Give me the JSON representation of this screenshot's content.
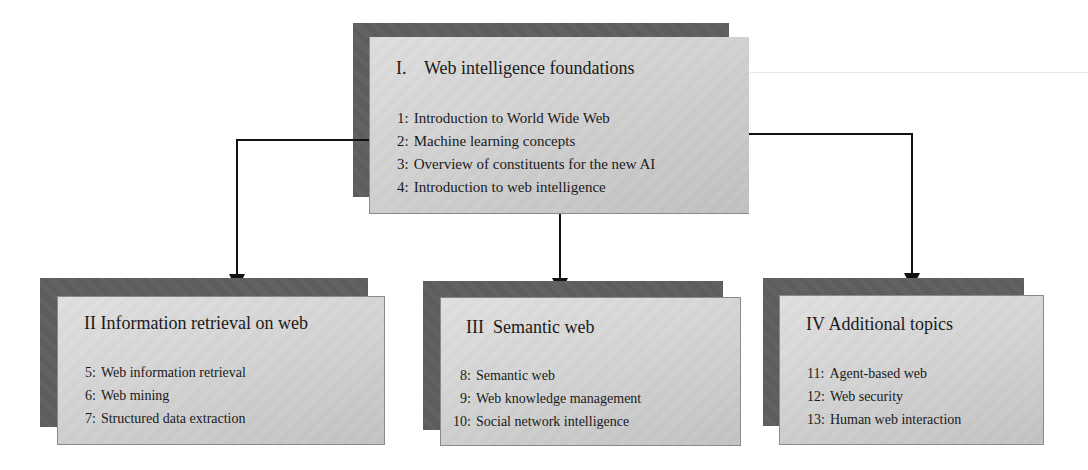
{
  "diagram": {
    "top": {
      "roman": "I.",
      "title": "Web intelligence foundations",
      "items": [
        {
          "num": "1:",
          "label": "Introduction to World Wide Web"
        },
        {
          "num": "2:",
          "label": "Machine learning concepts"
        },
        {
          "num": "3:",
          "label": "Overview of constituents for the new AI"
        },
        {
          "num": "4:",
          "label": "Introduction to web intelligence"
        }
      ]
    },
    "left": {
      "roman": "II",
      "title": "Information retrieval on web",
      "items": [
        {
          "num": "5:",
          "label": "Web information retrieval"
        },
        {
          "num": "6:",
          "label": "Web mining"
        },
        {
          "num": "7:",
          "label": "Structured data extraction"
        }
      ]
    },
    "middle": {
      "roman": "III",
      "title": "Semantic web",
      "items": [
        {
          "num": "8:",
          "label": "Semantic web"
        },
        {
          "num": "9:",
          "label": "Web knowledge management"
        },
        {
          "num": "10:",
          "label": "Social network intelligence"
        }
      ]
    },
    "right": {
      "roman": "IV",
      "title": "Additional topics",
      "items": [
        {
          "num": "11:",
          "label": "Agent-based web"
        },
        {
          "num": "12:",
          "label": "Web security"
        },
        {
          "num": "13:",
          "label": "Human web interaction"
        }
      ]
    },
    "connectors": [
      {
        "from": "top",
        "to": "left"
      },
      {
        "from": "top",
        "to": "middle"
      },
      {
        "from": "top",
        "to": "right"
      }
    ],
    "colors": {
      "shadow": "#5e5e5e",
      "card_light": "#e2e2e2",
      "card_dark": "#c4c4c4",
      "arrow": "#111111"
    }
  }
}
